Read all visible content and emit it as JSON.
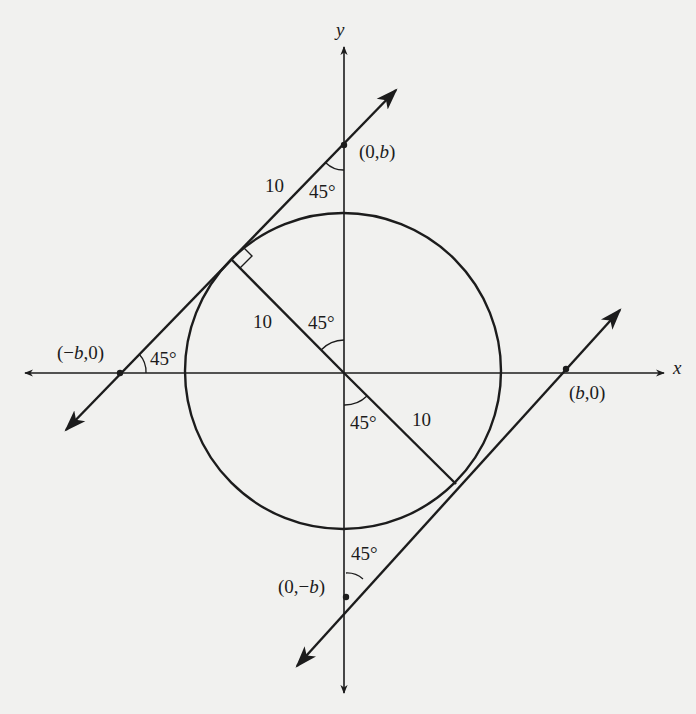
{
  "diagram": {
    "colors": {
      "background": "#f1f1ef",
      "ink": "#1c1c1c"
    },
    "axes": {
      "x_label": "x",
      "y_label": "y"
    },
    "points": {
      "top": "(0,b)",
      "left": "(−b,0)",
      "right": "(b,0)",
      "bottom": "(0,−b)"
    },
    "lengths": {
      "upper_tangent_segment": "10",
      "upper_radius": "10",
      "lower_radius": "10"
    },
    "angles": {
      "at_top_point": "45°",
      "at_left_point": "45°",
      "at_origin_upper": "45°",
      "at_origin_lower": "45°",
      "at_bottom_point": "45°"
    },
    "circle_radius": 10
  }
}
